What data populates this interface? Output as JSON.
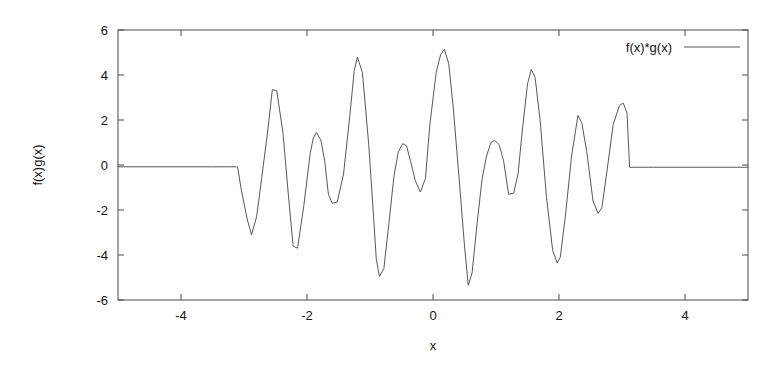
{
  "figure": {
    "background_color": "#ffffff",
    "line_color": "#585858",
    "axis_color": "#4a4a4a",
    "text_color": "#141414",
    "width": 784,
    "height": 368
  },
  "chart_data": {
    "type": "line",
    "title": "",
    "xlabel": "x",
    "ylabel": "f(x)g(x)",
    "xlim": [
      -5,
      5
    ],
    "ylim": [
      -6,
      6
    ],
    "xticks": [
      -4,
      -2,
      0,
      2,
      4
    ],
    "xtick_labels": [
      "-4",
      "-2",
      "0",
      "2",
      "4"
    ],
    "yticks": [
      -6,
      -4,
      -2,
      0,
      2,
      4,
      6
    ],
    "ytick_labels": [
      "-6",
      "-4",
      "-2",
      "0",
      "2",
      "4",
      "6"
    ],
    "grid": false,
    "border": true,
    "legend_position": "top-right",
    "legend_entries": [
      "f(x)*g(x)"
    ],
    "series": [
      {
        "name": "f(x)*g(x)",
        "color": "#585858",
        "x": [
          -5.0,
          -4.0,
          -3.5,
          -3.2,
          -3.12,
          -3.1,
          -3.05,
          -2.95,
          -2.88,
          -2.8,
          -2.72,
          -2.62,
          -2.55,
          -2.48,
          -2.38,
          -2.3,
          -2.22,
          -2.15,
          -2.05,
          -1.95,
          -1.9,
          -1.85,
          -1.78,
          -1.72,
          -1.66,
          -1.6,
          -1.52,
          -1.42,
          -1.32,
          -1.25,
          -1.2,
          -1.12,
          -1.02,
          -0.95,
          -0.9,
          -0.85,
          -0.78,
          -0.7,
          -0.62,
          -0.55,
          -0.48,
          -0.42,
          -0.35,
          -0.28,
          -0.2,
          -0.12,
          -0.05,
          0.05,
          0.12,
          0.18,
          0.25,
          0.32,
          0.42,
          0.5,
          0.56,
          0.62,
          0.7,
          0.78,
          0.85,
          0.92,
          0.98,
          1.05,
          1.12,
          1.2,
          1.28,
          1.35,
          1.42,
          1.5,
          1.56,
          1.62,
          1.7,
          1.8,
          1.9,
          1.97,
          2.02,
          2.1,
          2.2,
          2.3,
          2.36,
          2.44,
          2.54,
          2.62,
          2.68,
          2.76,
          2.86,
          2.96,
          3.02,
          3.08,
          3.12,
          3.5,
          4.0,
          5.0
        ],
        "y": [
          -0.08,
          -0.08,
          -0.08,
          -0.08,
          -0.08,
          -0.1,
          -1.0,
          -2.4,
          -3.1,
          -2.3,
          -0.6,
          1.6,
          3.35,
          3.3,
          1.4,
          -1.2,
          -3.6,
          -3.7,
          -1.8,
          0.5,
          1.2,
          1.45,
          1.1,
          0.2,
          -1.3,
          -1.7,
          -1.65,
          -0.4,
          2.2,
          4.2,
          4.8,
          4.1,
          0.9,
          -2.0,
          -4.2,
          -4.95,
          -4.6,
          -2.6,
          -0.5,
          0.6,
          0.95,
          0.85,
          0.1,
          -0.7,
          -1.2,
          -0.6,
          1.8,
          4.1,
          4.9,
          5.15,
          4.5,
          2.6,
          -0.8,
          -3.6,
          -5.35,
          -4.8,
          -2.6,
          -0.6,
          0.4,
          1.0,
          1.1,
          0.9,
          0.2,
          -1.3,
          -1.25,
          -0.4,
          1.6,
          3.6,
          4.25,
          3.9,
          2.0,
          -1.4,
          -3.8,
          -4.35,
          -4.1,
          -2.3,
          0.4,
          2.2,
          1.9,
          0.6,
          -1.6,
          -2.15,
          -1.9,
          -0.3,
          1.8,
          2.65,
          2.75,
          2.3,
          -0.1,
          -0.1,
          -0.1,
          -0.1
        ]
      }
    ]
  }
}
